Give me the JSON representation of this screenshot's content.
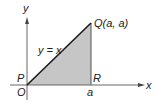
{
  "diagram": {
    "axes": {
      "x_label": "x",
      "y_label": "y"
    },
    "points": {
      "origin_label": "O",
      "p_label": "P",
      "q_label": "Q(a, a)",
      "r_label": "R",
      "a_tick_label": "a"
    },
    "line_label": "y = x",
    "colors": {
      "shade": "#c6c6c6",
      "line": "#1a1a1a",
      "axis": "#555555"
    }
  }
}
